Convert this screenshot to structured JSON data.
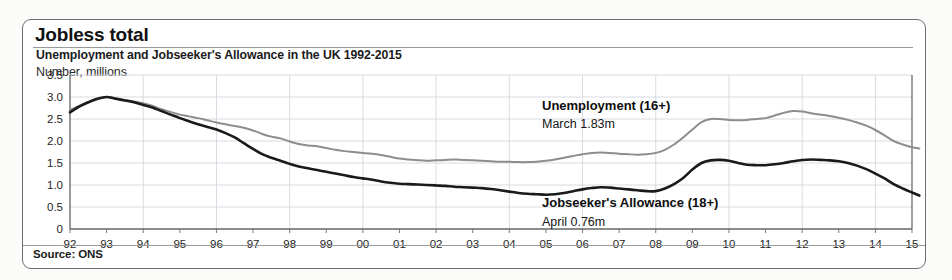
{
  "header": {
    "title": "Jobless total",
    "subtitle": "Unemployment and Jobseeker's Allowance in the UK 1992-2015",
    "axis_title": "Number, millions"
  },
  "footer": {
    "source": "Source: ONS"
  },
  "annotations": {
    "unemployment": {
      "label": "Unemployment (16+)",
      "value_text": "March 1.83m"
    },
    "jsa": {
      "label": "Jobseeker's Allowance (18+)",
      "value_text": "April 0.76m"
    }
  },
  "colors": {
    "unemployment_line": "#8d8d8d",
    "jsa_line": "#1a1a1a",
    "grid": "#d2d6dd",
    "axis": "#6b6b6b",
    "border": "#6e6e6e"
  },
  "chart_data": {
    "type": "line",
    "title": "Jobless total",
    "subtitle": "Unemployment and Jobseeker's Allowance in the UK 1992-2015",
    "xlabel": "",
    "ylabel": "Number, millions",
    "ylim": [
      0,
      3.5
    ],
    "yticks": [
      0,
      0.5,
      1.0,
      1.5,
      2.0,
      2.5,
      3.0,
      3.5
    ],
    "ytick_labels": [
      "0",
      "0.5",
      "1.0",
      "1.5",
      "2.0",
      "2.5",
      "3.0",
      "3.5"
    ],
    "xlim": [
      1992,
      2015
    ],
    "xticks": [
      1992,
      1993,
      1994,
      1995,
      1996,
      1997,
      1998,
      1999,
      2000,
      2001,
      2002,
      2003,
      2004,
      2005,
      2006,
      2007,
      2008,
      2009,
      2010,
      2011,
      2012,
      2013,
      2014,
      2015
    ],
    "xtick_labels": [
      "92",
      "93",
      "94",
      "95",
      "96",
      "97",
      "98",
      "99",
      "00",
      "01",
      "02",
      "03",
      "04",
      "05",
      "06",
      "07",
      "08",
      "09",
      "10",
      "11",
      "12",
      "13",
      "14",
      "15"
    ],
    "grid": true,
    "legend": "annotated-inline",
    "x": [
      1992.0,
      1992.25,
      1992.5,
      1992.75,
      1993.0,
      1993.25,
      1993.5,
      1993.75,
      1994.0,
      1994.25,
      1994.5,
      1994.75,
      1995.0,
      1995.25,
      1995.5,
      1995.75,
      1996.0,
      1996.25,
      1996.5,
      1996.75,
      1997.0,
      1997.25,
      1997.5,
      1997.75,
      1998.0,
      1998.25,
      1998.5,
      1998.75,
      1999.0,
      1999.25,
      1999.5,
      1999.75,
      2000.0,
      2000.25,
      2000.5,
      2000.75,
      2001.0,
      2001.25,
      2001.5,
      2001.75,
      2002.0,
      2002.25,
      2002.5,
      2002.75,
      2003.0,
      2003.25,
      2003.5,
      2003.75,
      2004.0,
      2004.25,
      2004.5,
      2004.75,
      2005.0,
      2005.25,
      2005.5,
      2005.75,
      2006.0,
      2006.25,
      2006.5,
      2006.75,
      2007.0,
      2007.25,
      2007.5,
      2007.75,
      2008.0,
      2008.25,
      2008.5,
      2008.75,
      2009.0,
      2009.25,
      2009.5,
      2009.75,
      2010.0,
      2010.25,
      2010.5,
      2010.75,
      2011.0,
      2011.25,
      2011.5,
      2011.75,
      2012.0,
      2012.25,
      2012.5,
      2012.75,
      2013.0,
      2013.25,
      2013.5,
      2013.75,
      2014.0,
      2014.25,
      2014.5,
      2014.75,
      2015.0,
      2015.2
    ],
    "series": [
      {
        "name": "Unemployment (16+)",
        "color": "#8d8d8d",
        "latest_label": "March 1.83m",
        "latest_value": 1.83,
        "values": [
          2.7,
          2.8,
          2.88,
          2.95,
          3.0,
          2.97,
          2.93,
          2.9,
          2.86,
          2.8,
          2.72,
          2.66,
          2.6,
          2.56,
          2.52,
          2.47,
          2.42,
          2.38,
          2.34,
          2.3,
          2.24,
          2.16,
          2.1,
          2.06,
          1.99,
          1.93,
          1.9,
          1.88,
          1.84,
          1.8,
          1.77,
          1.75,
          1.73,
          1.71,
          1.68,
          1.64,
          1.6,
          1.58,
          1.56,
          1.55,
          1.56,
          1.57,
          1.58,
          1.57,
          1.56,
          1.55,
          1.54,
          1.53,
          1.53,
          1.52,
          1.52,
          1.53,
          1.55,
          1.58,
          1.62,
          1.66,
          1.7,
          1.73,
          1.74,
          1.73,
          1.71,
          1.7,
          1.69,
          1.7,
          1.73,
          1.8,
          1.92,
          2.08,
          2.26,
          2.43,
          2.5,
          2.5,
          2.48,
          2.47,
          2.48,
          2.5,
          2.52,
          2.58,
          2.64,
          2.68,
          2.67,
          2.63,
          2.6,
          2.57,
          2.53,
          2.48,
          2.42,
          2.35,
          2.25,
          2.13,
          2.0,
          1.92,
          1.86,
          1.83
        ]
      },
      {
        "name": "Jobseeker's Allowance (18+)",
        "color": "#1a1a1a",
        "latest_label": "April 0.76m",
        "latest_value": 0.76,
        "values": [
          2.65,
          2.78,
          2.88,
          2.96,
          3.0,
          2.96,
          2.92,
          2.88,
          2.82,
          2.76,
          2.68,
          2.6,
          2.52,
          2.45,
          2.38,
          2.32,
          2.26,
          2.18,
          2.08,
          1.95,
          1.82,
          1.7,
          1.62,
          1.55,
          1.48,
          1.42,
          1.38,
          1.34,
          1.3,
          1.26,
          1.22,
          1.18,
          1.15,
          1.12,
          1.08,
          1.05,
          1.03,
          1.02,
          1.01,
          1.0,
          0.99,
          0.98,
          0.96,
          0.95,
          0.94,
          0.93,
          0.91,
          0.88,
          0.85,
          0.82,
          0.8,
          0.79,
          0.78,
          0.79,
          0.82,
          0.86,
          0.9,
          0.93,
          0.95,
          0.94,
          0.92,
          0.9,
          0.88,
          0.86,
          0.86,
          0.92,
          1.02,
          1.16,
          1.35,
          1.5,
          1.56,
          1.57,
          1.55,
          1.5,
          1.46,
          1.45,
          1.45,
          1.47,
          1.5,
          1.54,
          1.57,
          1.58,
          1.57,
          1.56,
          1.54,
          1.5,
          1.44,
          1.36,
          1.26,
          1.15,
          1.02,
          0.92,
          0.83,
          0.76
        ]
      }
    ]
  }
}
